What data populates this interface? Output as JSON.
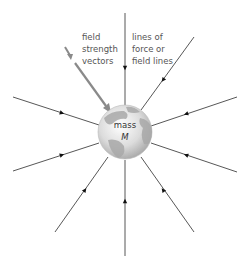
{
  "diagram": {
    "labels": {
      "field_strength": [
        "field",
        "strength",
        "vectors"
      ],
      "field_lines": [
        "lines of",
        "force or",
        "field lines"
      ],
      "mass_line1": "mass",
      "mass_line2": "M"
    },
    "colors": {
      "line": "#444444",
      "vector": "#888888",
      "globe_light": "#f0f0f0",
      "globe_dark": "#9a9a9a",
      "text": "#555555"
    },
    "globe": {
      "cx": 125,
      "cy": 132,
      "r": 27
    },
    "field_lines": [
      {
        "name": "top",
        "x1": 125,
        "y1": 13,
        "x2": 125,
        "y2": 106,
        "ax": 125,
        "ay": 68
      },
      {
        "name": "top-right",
        "x1": 194,
        "y1": 37,
        "x2": 141,
        "y2": 110,
        "ax": 163,
        "ay": 80
      },
      {
        "name": "right-upper",
        "x1": 237,
        "y1": 97,
        "x2": 151,
        "y2": 126,
        "ax": 186,
        "ay": 114
      },
      {
        "name": "right-lower",
        "x1": 237,
        "y1": 172,
        "x2": 151,
        "y2": 143,
        "ax": 186,
        "ay": 155
      },
      {
        "name": "bottom-right",
        "x1": 194,
        "y1": 232,
        "x2": 141,
        "y2": 157,
        "ax": 163,
        "ay": 190
      },
      {
        "name": "bottom",
        "x1": 125,
        "y1": 256,
        "x2": 125,
        "y2": 160,
        "ax": 125,
        "ay": 201
      },
      {
        "name": "bottom-left",
        "x1": 55,
        "y1": 232,
        "x2": 108,
        "y2": 157,
        "ax": 85,
        "ay": 190
      },
      {
        "name": "left-lower",
        "x1": 13,
        "y1": 171,
        "x2": 99,
        "y2": 143,
        "ax": 62,
        "ay": 155
      },
      {
        "name": "left-upper",
        "x1": 13,
        "y1": 97,
        "x2": 99,
        "y2": 125,
        "ax": 62,
        "ay": 113
      }
    ]
  }
}
